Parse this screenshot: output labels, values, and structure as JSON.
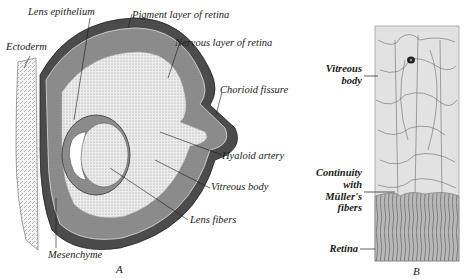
{
  "figure": {
    "panel_a": {
      "letter": "A",
      "labels": {
        "lens_epithelium": "Lens epithelium",
        "pigment_layer": "Pigment layer of retina",
        "ectoderm": "Ectoderm",
        "nervous_layer": "Nervous layer of retina",
        "chorioid_fissure": "Chorioid fissure",
        "hyaloid_artery": "Hyaloid artery",
        "vitreous_body": "Vitreous body",
        "lens_fibers": "Lens fibers",
        "mesenchyme": "Mesenchyme"
      }
    },
    "panel_b": {
      "letter": "B",
      "labels": {
        "vitreous_line1": "Vitreous",
        "vitreous_line2": "body",
        "continuity_line1": "Continuity",
        "continuity_line2": "with",
        "continuity_line3": "Müller's",
        "continuity_line4": "fibers",
        "retina": "Retina"
      }
    },
    "colors": {
      "ink": "#1a1a1a",
      "pigment": "#4a4a4a",
      "nervous": "#9a9a9a",
      "vitreous_fill": "#e6e6e6",
      "panel_b_bg": "#dcdcdc",
      "retina_fill": "#b5b5b5"
    }
  }
}
